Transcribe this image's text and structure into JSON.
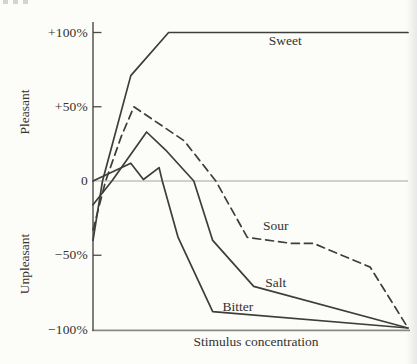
{
  "figure": {
    "background": "#fcfcf9",
    "ink": "#3d3d3b",
    "axis_color": "#4a4a46",
    "baseline_color": "#8a8a85",
    "zero_line_color": "#a6a6a0",
    "y_axis_upper_label": "Pleasant",
    "y_axis_lower_label": "Unpleasant",
    "x_axis_label": "Stimulus concentration",
    "y_ticks": [
      {
        "label": "+100%",
        "pct": 100,
        "tick_mark": true
      },
      {
        "label": "+50%",
        "pct": 50,
        "tick_mark": true
      },
      {
        "label": "0",
        "pct": 0,
        "tick_mark": false
      },
      {
        "label": "−50%",
        "pct": -50,
        "tick_mark": true
      },
      {
        "label": "−100%",
        "pct": -100,
        "tick_mark": false
      }
    ]
  },
  "chart_data": {
    "type": "line",
    "title": "",
    "xlabel": "Stimulus concentration",
    "ylabel_positive_region": "Pleasant",
    "ylabel_negative_region": "Unpleasant",
    "ylim": [
      -100,
      100
    ],
    "y_tick_labels": [
      "+100%",
      "+50%",
      "0",
      "−50%",
      "−100%"
    ],
    "x_axis_numeric_labels_shown": false,
    "x_units": "normalized_0_100",
    "grid": false,
    "zero_reference_line": true,
    "legend": "inline curve labels",
    "series": [
      {
        "name": "Sweet",
        "style": "solid",
        "points": [
          [
            0,
            -40
          ],
          [
            3,
            0
          ],
          [
            12,
            71
          ],
          [
            24,
            100
          ],
          [
            100,
            100
          ]
        ],
        "label_pos": [
          61,
          94
        ]
      },
      {
        "name": "Sour",
        "style": "dashed",
        "points": [
          [
            0,
            -33
          ],
          [
            4,
            0
          ],
          [
            9,
            30
          ],
          [
            13,
            50
          ],
          [
            29,
            27
          ],
          [
            39,
            0
          ],
          [
            49,
            -38
          ],
          [
            63,
            -42
          ],
          [
            70,
            -42
          ],
          [
            88,
            -58
          ],
          [
            100,
            -99
          ]
        ],
        "label_pos": [
          58,
          -30
        ]
      },
      {
        "name": "Salt",
        "style": "solid",
        "points": [
          [
            0,
            -16
          ],
          [
            6,
            0
          ],
          [
            17,
            33
          ],
          [
            23,
            21
          ],
          [
            32,
            0
          ],
          [
            38,
            -40
          ],
          [
            51,
            -71
          ],
          [
            100,
            -99
          ]
        ],
        "label_pos": [
          58,
          -69
        ]
      },
      {
        "name": "Bitter",
        "style": "solid",
        "points": [
          [
            0,
            0
          ],
          [
            12,
            12
          ],
          [
            16,
            1
          ],
          [
            21,
            9
          ],
          [
            22,
            0
          ],
          [
            27,
            -38
          ],
          [
            38,
            -88
          ],
          [
            100,
            -99
          ]
        ],
        "label_pos": [
          46,
          -85
        ]
      }
    ]
  }
}
